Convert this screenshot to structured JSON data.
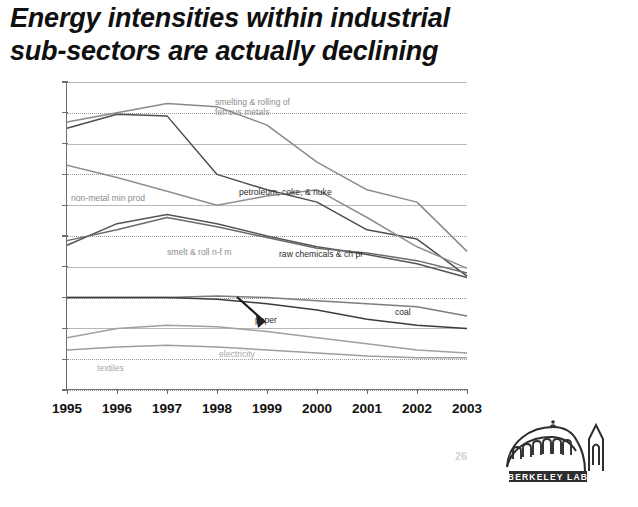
{
  "title": {
    "line1": "Energy intensities within industrial",
    "line2": "sub-sectors are actually declining"
  },
  "footer": {
    "page_number": "26",
    "logo_text": "BERKELEY LAB",
    "logo_name": "berkeley-lab-logo"
  },
  "chart_data": {
    "type": "line",
    "title": "Energy intensities within industrial sub-sectors are actually declining",
    "xlabel": "",
    "ylabel": "",
    "x": [
      1995,
      1996,
      1997,
      1998,
      1999,
      2000,
      2001,
      2002,
      2003
    ],
    "xlim": [
      1995,
      2003
    ],
    "ylim": [
      0.0,
      2.0
    ],
    "yticks": [
      "0.0",
      "0.2",
      "0.4",
      "0.6",
      "0.8",
      "1.0",
      "1.2",
      "1.4",
      "1.6",
      "1.8",
      "2.0"
    ],
    "xticks": [
      "1995",
      "1996",
      "1997",
      "1998",
      "1999",
      "2000",
      "2001",
      "2002",
      "2003"
    ],
    "grid": true,
    "legend": "inline-annotations",
    "series": [
      {
        "name": "smelting & rolling of ferrous metals",
        "label": "smelting & rolling of",
        "label2": "ferrous metals",
        "color": "#8a8a8a",
        "values": [
          1.74,
          1.8,
          1.86,
          1.84,
          1.72,
          1.48,
          1.3,
          1.22,
          0.9
        ]
      },
      {
        "name": "petroleum, coke, & nuke",
        "label": "petroleum, coke, & nuke",
        "color": "#4d4d4d",
        "values": [
          1.7,
          1.79,
          1.78,
          1.4,
          1.3,
          1.22,
          1.04,
          0.98,
          0.74
        ]
      },
      {
        "name": "non-metal min prod",
        "label": "non-metal min prod",
        "color": "#909090",
        "values": [
          1.46,
          1.38,
          1.29,
          1.2,
          1.26,
          1.3,
          1.12,
          0.93,
          0.79
        ]
      },
      {
        "name": "smelt & roll n-f m",
        "label": "smelt & roll n-f m",
        "color": "#565656",
        "values": [
          0.94,
          1.08,
          1.14,
          1.08,
          1.0,
          0.93,
          0.88,
          0.82,
          0.73
        ]
      },
      {
        "name": "raw chemicals & ch pr",
        "label": "raw chemicals & ch pr",
        "color": "#6a6a6a",
        "values": [
          0.97,
          1.04,
          1.12,
          1.06,
          0.99,
          0.92,
          0.89,
          0.84,
          0.76
        ]
      },
      {
        "name": "paper",
        "label": "paper",
        "color": "#7c7c7c",
        "values": [
          0.6,
          0.6,
          0.6,
          0.61,
          0.6,
          0.58,
          0.56,
          0.54,
          0.48
        ]
      },
      {
        "name": "coal",
        "label": "coal",
        "color": "#3c3c3c",
        "values": [
          0.6,
          0.6,
          0.6,
          0.59,
          0.56,
          0.52,
          0.46,
          0.42,
          0.4
        ]
      },
      {
        "name": "electricity",
        "label": "electricity",
        "color": "#a0a0a0",
        "values": [
          0.34,
          0.4,
          0.42,
          0.41,
          0.38,
          0.34,
          0.3,
          0.26,
          0.24
        ]
      },
      {
        "name": "textiles",
        "label": "textiles",
        "color": "#9e9e9e",
        "values": [
          0.26,
          0.28,
          0.29,
          0.28,
          0.26,
          0.24,
          0.22,
          0.21,
          0.21
        ]
      }
    ],
    "annotations": [
      {
        "name": "coal-arrow",
        "text": "",
        "points_to": "coal"
      }
    ]
  }
}
